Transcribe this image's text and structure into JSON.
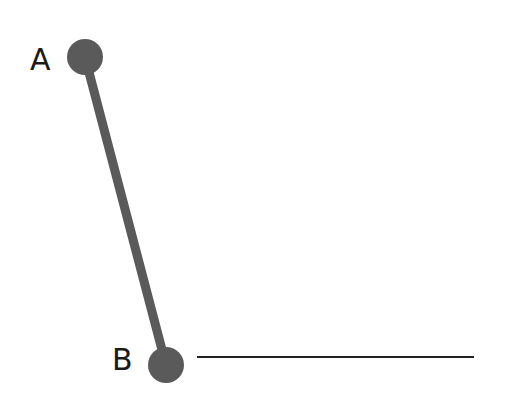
{
  "diagram": {
    "points": [
      {
        "id": "A",
        "label": "A",
        "cx": 85,
        "cy": 57,
        "r": 18,
        "label_x": 30,
        "label_y": 70
      },
      {
        "id": "B",
        "label": "B",
        "cx": 166,
        "cy": 365,
        "r": 18,
        "label_x": 112,
        "label_y": 370
      }
    ],
    "segment_AB": {
      "x1": 85,
      "y1": 57,
      "x2": 166,
      "y2": 365,
      "stroke": "#5a5a5a",
      "width": 9
    },
    "baseline": {
      "x1": 197,
      "y1": 357,
      "x2": 474,
      "y2": 357,
      "stroke": "#222222",
      "width": 2
    },
    "point_color": "#5a5a5a"
  }
}
